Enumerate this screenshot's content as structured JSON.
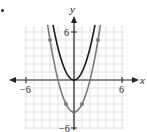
{
  "chart_data": {
    "type": "line",
    "title": "",
    "xlabel": "x",
    "ylabel": "y",
    "xlim": [
      -6.5,
      6.5
    ],
    "ylim": [
      -6.5,
      6.5
    ],
    "grid": true,
    "x_ticks": [
      -6,
      6
    ],
    "y_ticks": [
      6,
      -6
    ],
    "x_tick_labels": [
      "−6",
      "6"
    ],
    "y_tick_labels": [
      "6",
      "−6"
    ],
    "series": [
      {
        "name": "y = x^2",
        "color": "#1a1a1a",
        "equation": "y = x^2",
        "x": [
          -2.5,
          -2,
          -1,
          0,
          1,
          2,
          2.5
        ],
        "y": [
          6.25,
          4,
          1,
          0,
          1,
          4,
          6.25
        ]
      },
      {
        "name": "y = x^2 - 4",
        "color": "#7a7a7a",
        "equation": "y = x^2 - 4",
        "x": [
          -3.3,
          -3,
          -2,
          -1,
          0,
          1,
          2,
          3,
          3.3
        ],
        "y": [
          6.89,
          5,
          0,
          -3,
          -4,
          -3,
          0,
          5,
          6.89
        ],
        "marked_points": [
          [
            -3,
            5
          ],
          [
            -1,
            -3
          ],
          [
            0,
            -4
          ],
          [
            1,
            -3
          ],
          [
            3,
            5
          ]
        ]
      }
    ]
  },
  "labels": {
    "x_axis": "x",
    "y_axis": "y",
    "tick_neg6_x": "−6",
    "tick_pos6_x": "6",
    "tick_pos6_y": "6",
    "tick_neg6_y": "−6"
  }
}
